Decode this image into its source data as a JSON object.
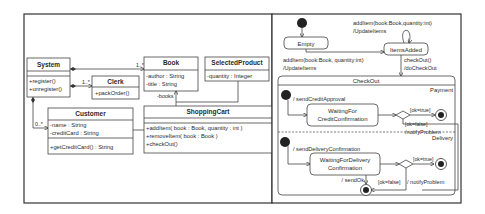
{
  "class_diagram": {
    "classes": {
      "system": {
        "name": "System",
        "methods": [
          "+register()",
          "+unregister()"
        ]
      },
      "clerk": {
        "name": "Clerk",
        "methods": [
          "+packOrder()"
        ]
      },
      "book": {
        "name": "Book",
        "attributes": [
          "-author : String",
          "-title : String"
        ]
      },
      "selected_product": {
        "name": "SelectedProduct",
        "attributes": [
          "-quantity : Integer"
        ]
      },
      "customer": {
        "name": "Customer",
        "attributes": [
          "-name : String",
          "-creditCard : String"
        ],
        "methods": [
          "+getCreditCard() : String"
        ]
      },
      "shopping_cart": {
        "name": "ShoppingCart",
        "methods": [
          "+addItem( book : Book, quantity : int )",
          "+removeItem( book : Book )",
          "+checkOut()"
        ]
      }
    },
    "multiplicities": {
      "system_book": "1..*",
      "system_clerk": "1..*",
      "system_customer": "0..*"
    },
    "roles": {
      "cart_books": "-books"
    }
  },
  "state_diagram": {
    "states": {
      "empty": "Empty",
      "items_added": "ItemsAdded"
    },
    "transitions": {
      "self_loop_line1": "addItem(book:Book,quantity:int)",
      "self_loop_line2": "/UpdateItems",
      "empty_to_added_line1": "addItem(book:Book, quantity:int)",
      "empty_to_added_line2": "/UpdateItems",
      "checkout_line1": "checkOut()",
      "checkout_line2": "/doCheckOut"
    },
    "composite": {
      "name": "CheckOut",
      "regions": {
        "payment": {
          "name": "Payment",
          "entry_action": "/ sendCreditApproval",
          "state_line1": "WaitingFor",
          "state_line2": "CreditConfirmation",
          "guard_true": "[ok=true]",
          "guard_false": "[ok=false]",
          "failure_action": "/notifyProblem"
        },
        "delivery": {
          "name": "Delivery",
          "entry_action": "/ sendDeliveryConfirmation",
          "state_line1": "WaitingForDelivery",
          "state_line2": "Confirmation",
          "guard_true": "[ok=true]",
          "guard_false": "[ok=false]",
          "failure_action": "/ notifyProblem"
        }
      },
      "exit_action": "/ sendOk"
    }
  }
}
